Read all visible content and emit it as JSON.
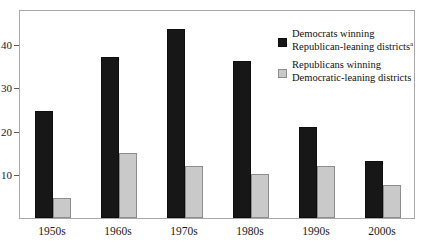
{
  "chart_data": {
    "type": "bar",
    "title": "",
    "subtitle": "",
    "xlabel": "",
    "ylabel": "",
    "categories": [
      "1950s",
      "1960s",
      "1970s",
      "1980s",
      "1990s",
      "2000s"
    ],
    "series": [
      {
        "name": "Democrats winning Republican-leaning districts",
        "color": "#171717",
        "values": [
          24.5,
          37,
          43.5,
          36,
          21,
          13
        ]
      },
      {
        "name": "Republicans winning Democratic-leaning districts",
        "color": "#c9c9c9",
        "values": [
          4.5,
          15,
          12,
          10,
          12,
          7.5
        ]
      }
    ],
    "yticks": [
      10,
      20,
      30,
      40
    ],
    "ytick_labels": [
      "10",
      "20",
      "30",
      "40"
    ],
    "ylim": [
      0,
      48
    ],
    "grid": false,
    "legend_position": "top-right"
  },
  "legend": {
    "items": [
      {
        "line1": "Democrats winning",
        "line2": "Republican-leaning districts",
        "superscript": "a",
        "swatch": "dem"
      },
      {
        "line1": "Republicans winning",
        "line2": "Democratic-leaning districts",
        "superscript": "",
        "swatch": "rep"
      }
    ]
  }
}
